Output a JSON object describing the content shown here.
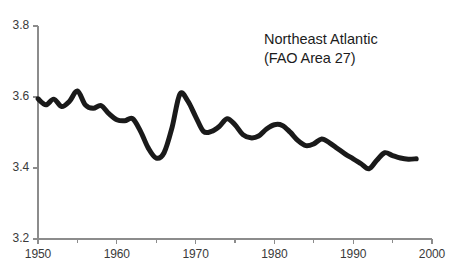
{
  "chart_data": {
    "type": "line",
    "title": "",
    "annotation": {
      "line1": "Northeast Atlantic",
      "line2": "(FAO Area 27)"
    },
    "xlabel": "",
    "ylabel": "",
    "xlim": [
      1950,
      2000
    ],
    "ylim": [
      3.2,
      3.8
    ],
    "grid": false,
    "legend": null,
    "x_ticks": [
      1950,
      1960,
      1970,
      1980,
      1990,
      2000
    ],
    "x_tick_labels": [
      "1950",
      "1960",
      "1970",
      "1980",
      "1990",
      "2000"
    ],
    "x_minor_ticks": [
      1955,
      1965,
      1975,
      1985,
      1995
    ],
    "y_ticks": [
      3.2,
      3.4,
      3.6,
      3.8
    ],
    "y_tick_labels": [
      "3.2",
      "3.4",
      "3.6",
      "3.8"
    ],
    "line_color": "#1a1a1a",
    "line_width": 5,
    "axis_color": "#8c8c8c",
    "x": [
      1950,
      1951,
      1952,
      1953,
      1954,
      1955,
      1956,
      1957,
      1958,
      1959,
      1960,
      1961,
      1962,
      1963,
      1964,
      1965,
      1966,
      1967,
      1968,
      1969,
      1970,
      1971,
      1972,
      1973,
      1974,
      1975,
      1976,
      1977,
      1978,
      1979,
      1980,
      1981,
      1982,
      1983,
      1984,
      1985,
      1986,
      1987,
      1988,
      1989,
      1990,
      1991,
      1992,
      1993,
      1994,
      1995,
      1996,
      1997,
      1998
    ],
    "values": [
      3.595,
      3.578,
      3.594,
      3.573,
      3.588,
      3.617,
      3.578,
      3.568,
      3.576,
      3.553,
      3.536,
      3.533,
      3.539,
      3.504,
      3.456,
      3.428,
      3.443,
      3.513,
      3.608,
      3.589,
      3.545,
      3.503,
      3.503,
      3.517,
      3.539,
      3.522,
      3.494,
      3.485,
      3.49,
      3.51,
      3.522,
      3.52,
      3.501,
      3.477,
      3.463,
      3.468,
      3.482,
      3.471,
      3.455,
      3.439,
      3.426,
      3.412,
      3.398,
      3.422,
      3.443,
      3.435,
      3.428,
      3.425,
      3.426
    ],
    "series": [
      {
        "name": "Northeast Atlantic mean trophic level",
        "values": [
          3.595,
          3.578,
          3.594,
          3.573,
          3.588,
          3.617,
          3.578,
          3.568,
          3.576,
          3.553,
          3.536,
          3.533,
          3.539,
          3.504,
          3.456,
          3.428,
          3.443,
          3.513,
          3.608,
          3.589,
          3.545,
          3.503,
          3.503,
          3.517,
          3.539,
          3.522,
          3.494,
          3.485,
          3.49,
          3.51,
          3.522,
          3.52,
          3.501,
          3.477,
          3.463,
          3.468,
          3.482,
          3.471,
          3.455,
          3.439,
          3.426,
          3.412,
          3.398,
          3.422,
          3.443,
          3.435,
          3.428,
          3.425,
          3.426
        ]
      }
    ]
  }
}
